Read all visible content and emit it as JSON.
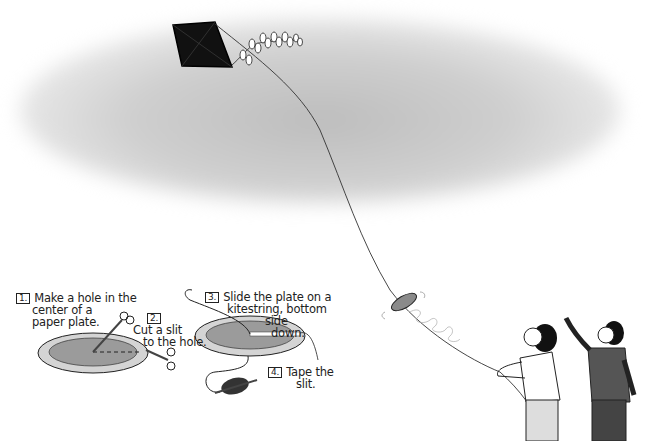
{
  "illustration": {
    "subject": "Kite string messenger made from a paper plate",
    "colors": {
      "cloud": "#c8c8c8",
      "kite": "#111111",
      "plate_rim": "#d2d2d2",
      "plate_center": "#9a9a9a",
      "boy_shirt": "#555555"
    }
  },
  "steps": [
    {
      "number": "1.",
      "text_lines": [
        "Make a hole in the",
        "center of a",
        "paper plate."
      ]
    },
    {
      "number": "2.",
      "text_lines": [
        "Cut a slit",
        "to the hole."
      ]
    },
    {
      "number": "3.",
      "text_lines": [
        "Slide the plate on a",
        "kitestring, bottom",
        "side",
        "down."
      ]
    },
    {
      "number": "4.",
      "text_lines": [
        "Tape the",
        "slit."
      ]
    }
  ]
}
